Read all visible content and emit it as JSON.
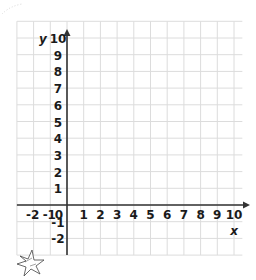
{
  "chart_data": {
    "type": "scatter",
    "title": "",
    "xlabel": "x",
    "ylabel": "y",
    "xlim": [
      -2,
      10
    ],
    "ylim": [
      -2,
      10
    ],
    "grid": true,
    "x_ticks": [
      "-2",
      "-1",
      "0",
      "1",
      "2",
      "3",
      "4",
      "5",
      "6",
      "7",
      "8",
      "9",
      "10"
    ],
    "y_ticks": [
      "10",
      "9",
      "8",
      "7",
      "6",
      "5",
      "4",
      "3",
      "2",
      "1",
      "-1",
      "-2"
    ],
    "x": [],
    "y": []
  },
  "colors": {
    "grid": "#dcdcdc",
    "axis": "#333333",
    "text": "#1a1a1a"
  },
  "decorations": {
    "star_sticker": "star-burst-icon"
  }
}
